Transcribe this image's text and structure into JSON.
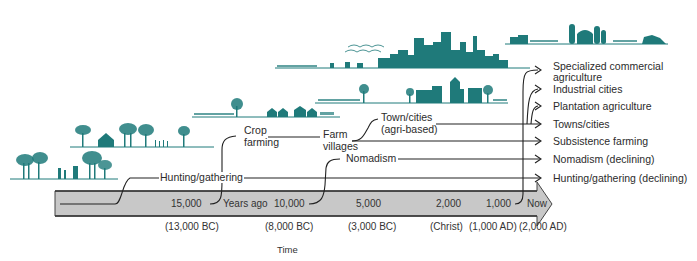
{
  "diagram": {
    "type": "timeline-flow",
    "accent_color": "#1f7a7a",
    "arrow_fill": "#c8c8c8",
    "axis": {
      "center_label": "Years ago",
      "title": "Time",
      "ticks": [
        {
          "label": "15,000",
          "date": "(13,000 BC)"
        },
        {
          "label": "10,000",
          "date": "(8,000 BC)"
        },
        {
          "label": "5,000",
          "date": "(3,000 BC)"
        },
        {
          "label": "2,000",
          "date": "(Christ)"
        },
        {
          "label": "1,000",
          "date": "(1,000 AD)"
        },
        {
          "label": "Now",
          "date": "(2,000 AD)"
        }
      ]
    },
    "stages": {
      "hunting": "Hunting/gathering",
      "crop_line1": "Crop",
      "crop_line2": "farming",
      "farm_line1": "Farm",
      "farm_line2": "villages",
      "nomadism": "Nomadism",
      "town_line1": "Town/cities",
      "town_line2": "(agri-based)"
    },
    "outcomes": [
      "Specialized commercial",
      "agriculture",
      "Industrial cities",
      "Plantation agriculture",
      "Towns/cities",
      "Subsistence farming",
      "Nomadism (declining)",
      "Hunting/gathering (declining)"
    ],
    "illustrations": [
      "forest-hunters-scene",
      "hut-and-trees-scene",
      "farm-village-scene",
      "town-scene",
      "industrial-city-skyline",
      "commercial-farm-silos-scene"
    ]
  }
}
